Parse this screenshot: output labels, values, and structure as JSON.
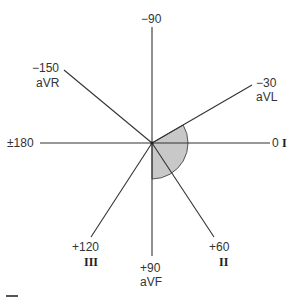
{
  "diagram": {
    "center": {
      "x": 152,
      "y": 143
    },
    "shaded_sector": {
      "from_deg": -30,
      "to_deg": 90,
      "radius": 36,
      "fill": "#c8c8c8",
      "stroke": "#555555"
    },
    "axes": [
      {
        "angle": "-90",
        "lead": ""
      },
      {
        "angle": "-30",
        "lead": "aVL"
      },
      {
        "angle": "0",
        "lead": "I"
      },
      {
        "angle": "+60",
        "lead": "II"
      },
      {
        "angle": "+90",
        "lead": "aVF"
      },
      {
        "angle": "+120",
        "lead": "III"
      },
      {
        "angle": "±180",
        "lead": ""
      },
      {
        "angle": "−150",
        "lead": "aVR"
      }
    ],
    "labels": {
      "top": "−90",
      "avl_angle": "−30",
      "avl_lead": "aVL",
      "i_angle": "0",
      "i_lead": "I",
      "ii_angle": "+60",
      "ii_lead": "II",
      "avf_angle": "+90",
      "avf_lead": "aVF",
      "iii_angle": "+120",
      "iii_lead": "III",
      "left": "±180",
      "avr_angle": "−150",
      "avr_lead": "aVR"
    },
    "colors": {
      "line": "#333333",
      "shade": "#c8c8c8"
    }
  }
}
